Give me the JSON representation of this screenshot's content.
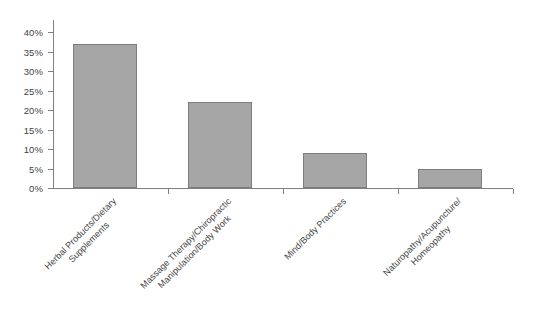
{
  "chart_data": {
    "type": "bar",
    "title": "",
    "subtitle": "",
    "xlabel": "",
    "ylabel": "",
    "ylim": [
      0,
      40
    ],
    "grid": false,
    "legend": false,
    "legend_position": "none",
    "value_suffix": "%",
    "categories": [
      "Herbal Products/Dietary Supplements",
      "Massage Therapy/Chiropractic Manipulation/Body Work",
      "Mind/Body Practices",
      "Naturopathy/Acupuncture/Homeopathy"
    ],
    "category_lines": [
      [
        "Herbal Products/Dietary",
        "Supplements"
      ],
      [
        "Massage Therapy/Chiropractic",
        "Manipulation/Body Work"
      ],
      [
        "Mind/Body Practices"
      ],
      [
        "Naturopathy/Acupuncture/",
        "Homeopathy"
      ]
    ],
    "values": [
      37,
      22,
      9,
      5
    ],
    "ytick_labels": [
      "0%",
      "5%",
      "10%",
      "15%",
      "20%",
      "25%",
      "30%",
      "35%",
      "40%"
    ],
    "ytick_values": [
      0,
      5,
      10,
      15,
      20,
      25,
      30,
      35,
      40
    ],
    "colors": {
      "bar_fill": "#a6a6a6",
      "bar_border": "#7d7d7d",
      "axis": "#808080",
      "text": "#3f3f3f",
      "background": "#ffffff"
    }
  }
}
